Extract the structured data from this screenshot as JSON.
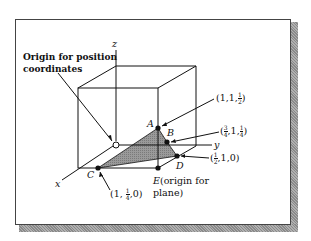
{
  "figure": {
    "axes": {
      "x": "x",
      "y": "y",
      "z": "z"
    },
    "origin_label": {
      "line1": "Origin for position",
      "line2": "coordinates"
    },
    "points": [
      {
        "name": "A",
        "coords": {
          "a": "1",
          "b": "1",
          "c_num": "1",
          "c_den": "2"
        }
      },
      {
        "name": "B",
        "coords": {
          "a_num": "3",
          "a_den": "4",
          "b": "1",
          "c_num": "1",
          "c_den": "4"
        }
      },
      {
        "name": "C",
        "coords": {
          "a": "1",
          "b_num": "1",
          "b_den": "4",
          "c": "0"
        }
      },
      {
        "name": "D",
        "coords": {
          "a_num": "1",
          "a_den": "2",
          "b": "1",
          "c": "0"
        }
      },
      {
        "name": "E",
        "note_line1": "(origin for",
        "note_line2": "plane)"
      }
    ],
    "colors": {
      "plane_fill": "#8c8c8c",
      "line": "#111111",
      "shadow": "#9a9a9a"
    }
  }
}
